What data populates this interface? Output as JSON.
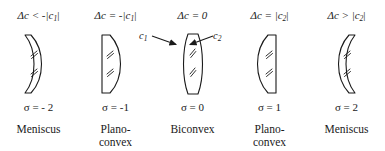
{
  "figure": {
    "background_color": "#ffffff",
    "stroke_color": "#1a1a1a"
  },
  "callouts": [
    {
      "id": "c1",
      "label": "c",
      "sub": "1",
      "points_to": "front-surface-of-biconvex-lens"
    },
    {
      "id": "c2",
      "label": "c",
      "sub": "2",
      "points_to": "rear-surface-of-biconvex-lens"
    }
  ],
  "columns": [
    {
      "condition_pre": "Δc < -|c",
      "condition_sub": "1",
      "condition_post": "|",
      "sigma": "σ = - 2",
      "name_line1": "Meniscus",
      "name_line2": "",
      "lens_type": "meniscus-left",
      "lens_icon": "meniscus-negative-icon"
    },
    {
      "condition_pre": "Δc = -|c",
      "condition_sub": "1",
      "condition_post": "|",
      "sigma": "σ = -1",
      "name_line1": "Plano-",
      "name_line2": "convex",
      "lens_type": "plano-convex-flat-left",
      "lens_icon": "plano-convex-left-icon"
    },
    {
      "condition_pre": "Δc = 0",
      "condition_sub": "",
      "condition_post": "",
      "sigma": "σ = 0",
      "name_line1": "Biconvex",
      "name_line2": "",
      "lens_type": "biconvex",
      "lens_icon": "biconvex-icon"
    },
    {
      "condition_pre": "Δc = |c",
      "condition_sub": "2",
      "condition_post": "|",
      "sigma": "σ = 1",
      "name_line1": "Plano-",
      "name_line2": "convex",
      "lens_type": "plano-convex-flat-right",
      "lens_icon": "plano-convex-right-icon"
    },
    {
      "condition_pre": "Δc > |c",
      "condition_sub": "2",
      "condition_post": "|",
      "sigma": "σ = 2",
      "name_line1": "Meniscus",
      "name_line2": "",
      "lens_type": "meniscus-right",
      "lens_icon": "meniscus-positive-icon"
    }
  ]
}
